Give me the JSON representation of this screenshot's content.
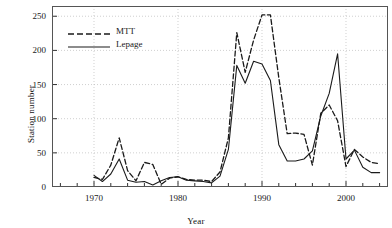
{
  "chart_data": {
    "type": "line",
    "title": "",
    "subtitle": "",
    "xlabel": "Year",
    "ylabel": "Station number",
    "xlim": [
      1965,
      2005
    ],
    "ylim": [
      0,
      265
    ],
    "xticks": [
      1970,
      1980,
      1990,
      2000
    ],
    "xticklabels": [
      "1970",
      "1980",
      "1990",
      "2000"
    ],
    "xminor_step": 2,
    "yticks": [
      0,
      50,
      100,
      150,
      200,
      250
    ],
    "yticklabels": [
      "0",
      "50",
      "100",
      "150",
      "200",
      "250"
    ],
    "grid": true,
    "grid_style": "dotted",
    "legend_position": "upper-left",
    "x": [
      1970,
      1971,
      1972,
      1973,
      1974,
      1975,
      1976,
      1977,
      1978,
      1979,
      1980,
      1981,
      1982,
      1983,
      1984,
      1985,
      1986,
      1987,
      1988,
      1989,
      1990,
      1991,
      1992,
      1993,
      1994,
      1995,
      1996,
      1997,
      1998,
      1999,
      2000,
      2001,
      2002,
      2003,
      2004
    ],
    "series": [
      {
        "name": "MTT",
        "style": "dashed",
        "color": "#1a1a1a",
        "values": [
          14,
          11,
          32,
          72,
          24,
          9,
          36,
          33,
          4,
          13,
          15,
          11,
          10,
          10,
          8,
          22,
          72,
          226,
          168,
          215,
          252,
          252,
          160,
          78,
          79,
          77,
          32,
          108,
          120,
          97,
          30,
          55,
          44,
          36,
          34
        ]
      },
      {
        "name": "Lepage",
        "style": "solid",
        "color": "#1a1a1a",
        "values": [
          17,
          8,
          19,
          41,
          10,
          7,
          8,
          3,
          9,
          14,
          15,
          10,
          9,
          8,
          6,
          16,
          55,
          178,
          152,
          184,
          180,
          156,
          62,
          38,
          38,
          41,
          53,
          104,
          137,
          195,
          41,
          54,
          29,
          21,
          21
        ]
      }
    ]
  },
  "legend": {
    "items": [
      {
        "label": "MTT",
        "key": "dashed-line-key"
      },
      {
        "label": "Lepage",
        "key": "solid-line-key"
      }
    ]
  },
  "axes": {
    "y_title": "Station number",
    "x_title": "Year"
  }
}
